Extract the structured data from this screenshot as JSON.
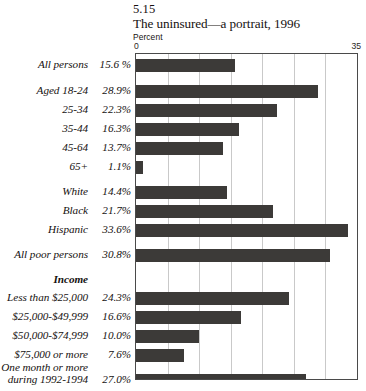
{
  "header": {
    "figure_number": "5.15",
    "title": "The uninsured—a portrait, 1996",
    "unit_label": "Percent"
  },
  "axis": {
    "min_label": "0",
    "max_label": "35"
  },
  "chart_data": {
    "type": "bar",
    "orientation": "horizontal",
    "title": "The uninsured—a portrait, 1996",
    "subtitle": "5.15",
    "xlabel": "Percent",
    "ylabel": "",
    "xlim": [
      0,
      35
    ],
    "grid": true,
    "legend": null,
    "bar_color": "#3c3a38",
    "categories": [
      "All persons",
      "Aged 18-24",
      "25-34",
      "35-44",
      "45-64",
      "65+",
      "White",
      "Black",
      "Hispanic",
      "All poor persons",
      "Less than $25,000",
      "$25,000-$49,999",
      "$50,000-$74,999",
      "$75,000 or more",
      "One month or more during 1992-1994"
    ],
    "values": [
      15.6,
      28.9,
      22.3,
      16.3,
      13.7,
      1.1,
      14.4,
      21.7,
      33.6,
      30.8,
      24.3,
      16.6,
      10.0,
      7.6,
      27.0
    ],
    "value_labels": [
      "15.6 %",
      "28.9%",
      "22.3%",
      "16.3%",
      "13.7%",
      "1.1%",
      "14.4%",
      "21.7%",
      "33.6%",
      "30.8%",
      "24.3%",
      "16.6%",
      "10.0%",
      "7.6%",
      "27.0%"
    ],
    "group_headings": [
      {
        "label": "Income",
        "before_category": "Less than $25,000"
      }
    ],
    "xticks": [
      0,
      35
    ],
    "xticklabels": [
      "0",
      "35"
    ],
    "gridline_values": [
      5,
      10,
      15,
      20,
      25,
      30
    ]
  },
  "rows": [
    {
      "cat": "All persons",
      "pct": "15.6 %",
      "value": 15.6,
      "top": 5,
      "kind": "bar"
    },
    {
      "cat": "Aged 18-24",
      "pct": "28.9%",
      "value": 28.9,
      "top": 31,
      "kind": "bar"
    },
    {
      "cat": "25-34",
      "pct": "22.3%",
      "value": 22.3,
      "top": 50,
      "kind": "bar"
    },
    {
      "cat": "35-44",
      "pct": "16.3%",
      "value": 16.3,
      "top": 69,
      "kind": "bar"
    },
    {
      "cat": "45-64",
      "pct": "13.7%",
      "value": 13.7,
      "top": 88,
      "kind": "bar"
    },
    {
      "cat": "65+",
      "pct": "1.1%",
      "value": 1.1,
      "top": 107,
      "kind": "bar"
    },
    {
      "cat": "White",
      "pct": "14.4%",
      "value": 14.4,
      "top": 132,
      "kind": "bar"
    },
    {
      "cat": "Black",
      "pct": "21.7%",
      "value": 21.7,
      "top": 151,
      "kind": "bar"
    },
    {
      "cat": "Hispanic",
      "pct": "33.6%",
      "value": 33.6,
      "top": 170,
      "kind": "bar"
    },
    {
      "cat": "All poor persons",
      "pct": "30.8%",
      "value": 30.8,
      "top": 195,
      "kind": "bar"
    },
    {
      "cat": "Income",
      "pct": "",
      "value": null,
      "top": 220,
      "kind": "heading"
    },
    {
      "cat": "Less than $25,000",
      "pct": "24.3%",
      "value": 24.3,
      "top": 238,
      "kind": "bar"
    },
    {
      "cat": "$25,000-$49,999",
      "pct": "16.6%",
      "value": 16.6,
      "top": 257,
      "kind": "bar"
    },
    {
      "cat": "$50,000-$74,999",
      "pct": "10.0%",
      "value": 10.0,
      "top": 276,
      "kind": "bar"
    },
    {
      "cat": "$75,000 or more",
      "pct": "7.6%",
      "value": 7.6,
      "top": 295,
      "kind": "bar"
    },
    {
      "cat": "One month or more during 1992-1994",
      "pct": "27.0%",
      "value": 27.0,
      "top": 320,
      "kind": "bar-twoline"
    }
  ]
}
